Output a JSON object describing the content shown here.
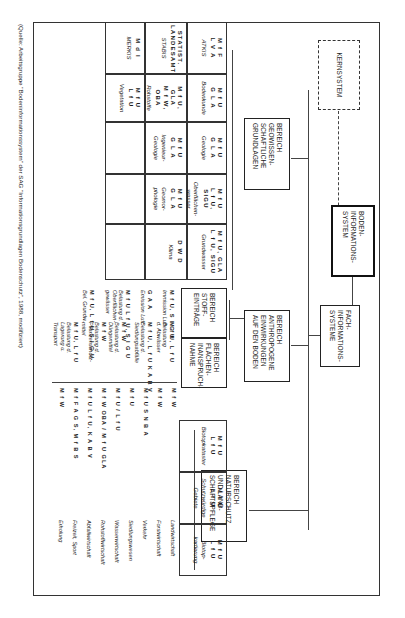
{
  "diagram": {
    "root": "Boden-informations-system",
    "kernsystem": "Kernsystem",
    "fachsysteme": "Fach-informations-systeme",
    "bereiche": [
      {
        "id": "geo",
        "label": "Bereich geowissen-schaftliche Grundlagen"
      },
      {
        "id": "anthro",
        "label": "Bereich anthropogene Einwirkungen auf den Boden"
      },
      {
        "id": "natur",
        "label": "Bereich Naturschutz und Land-schaftspflege"
      },
      {
        "id": "stoff",
        "label": "Bereich Stoff-einträge"
      },
      {
        "id": "flaechen",
        "label": "Bereich Flächen-inanspruch-nahme"
      }
    ],
    "geo_table": {
      "columns": [
        [
          {
            "org": "M f F\nL V A",
            "topic": "ATKIS"
          },
          {
            "org": "STATIST.\nLANDESAMT",
            "topic": "STABIS"
          },
          {
            "org": "M d I",
            "topic": "MERKIS"
          }
        ],
        [
          {
            "org": "M f U\nG L A",
            "topic": "Bodenkunde"
          },
          {
            "org": "M f U, GLA\nM f W, OBA",
            "topic": "Rohstoffe"
          },
          {
            "org": "M f U\nL f U",
            "topic": "Vegetation"
          }
        ],
        [
          {
            "org": "M f U\nG L A",
            "topic": "Geologie"
          },
          {
            "org": "M f U\nG L A",
            "topic": "Ingenieur-\nGeologie"
          },
          {
            "org": "",
            "topic": ""
          }
        ],
        [
          {
            "org": "M f U\nL f U, SIGU",
            "topic": "Oberflächen-\nwasser"
          },
          {
            "org": "M f U\nG L A",
            "topic": "Geomor-\nphologie"
          },
          {
            "org": "",
            "topic": ""
          }
        ],
        [
          {
            "org": "M f U, GLA\nL f U, SIGU",
            "topic": "Grundwasser"
          },
          {
            "org": "D W D",
            "topic": "Klima"
          },
          {
            "org": "",
            "topic": ""
          }
        ]
      ]
    },
    "stoff_items": [
      {
        "org": "M f U, S I G U",
        "topic": "Immission Luft"
      },
      {
        "org": "G A A",
        "topic": "Emission Luft"
      },
      {
        "org": "M f U\nL f U, S I G U",
        "topic": "Belastung d.\nOberflächen-\ngewässer"
      },
      {
        "org": "M f U, L f U\nS I G U",
        "topic": "Bel. Grundw."
      }
    ],
    "stoff_items_b": [
      {
        "org": "M f U, L f U",
        "topic": "Belastung\nd. Abwässer"
      },
      {
        "org": "M f U, L f U\nK A B V",
        "topic": "Belastung d.\nSiedlungsabfälle"
      },
      {
        "org": "M f W",
        "topic": "Belastung d.\nDüngemittel"
      },
      {
        "org": "M f W",
        "topic": "Belastung d.\nPflanzenschutz-\nmittel"
      },
      {
        "org": "M f U, L f U",
        "topic": "Belastung d.\nLagerung u.\nTransport"
      }
    ],
    "flaechen_items": [
      {
        "org": "M f W",
        "topic": "Landwirtschaft"
      },
      {
        "org": "M f W",
        "topic": "Forstwirtschaft"
      },
      {
        "org": "M f U  S N B A",
        "topic": "Verkehr"
      },
      {
        "org": "M f U",
        "topic": "Siedlungswesen"
      },
      {
        "org": "M f U / L f U",
        "topic": "Wasserwirtschaft"
      },
      {
        "org": "M f W  OBA / M f U  GLA",
        "topic": "Rohstoffwirtschaft"
      },
      {
        "org": "M f U  L f U,  K A B V",
        "topic": "Abfallwirtschaft"
      },
      {
        "org": "M f F A G S,  M f B S",
        "topic": "Freizeit, Sport"
      },
      {
        "org": "M f W",
        "topic": "Erholung"
      }
    ],
    "natur_table": [
      {
        "org": "M f U\nL f U",
        "topic": "Biotopkataster"
      },
      {
        "org": "M f U\nL f U",
        "topic": "Schutzwürdige\nGebiete"
      },
      {
        "org": "M f U\nL f U",
        "topic": "Biotop-\nkartierung"
      }
    ],
    "source": "(Quelle: Arbeitsgruppe \"Bodeninformationssystem\" der SAG \"Informationsgrundlagen Bodenschutz\", 1988, modifiziert)"
  }
}
